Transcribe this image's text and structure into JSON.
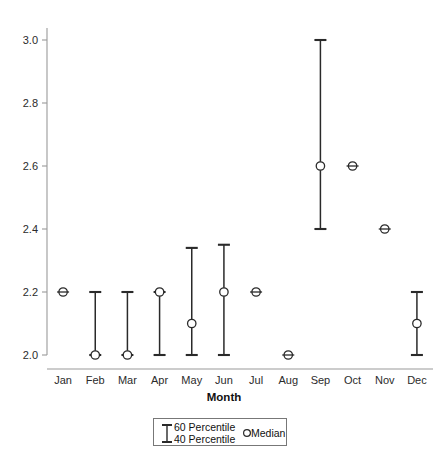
{
  "chart_data": {
    "type": "scatter",
    "title": "",
    "xlabel": "Month",
    "ylabel": "",
    "ylim": [
      2.0,
      3.0
    ],
    "yticks": [
      2.0,
      2.2,
      2.4,
      2.6,
      2.8,
      3.0
    ],
    "ytick_labels": [
      "2.0",
      "2.2",
      "2.4",
      "2.6",
      "2.8",
      "3.0"
    ],
    "grid": false,
    "legend_position": "below-axis-center",
    "categories": [
      "Jan",
      "Feb",
      "Mar",
      "Apr",
      "May",
      "Jun",
      "Jul",
      "Aug",
      "Sep",
      "Oct",
      "Nov",
      "Dec"
    ],
    "series": [
      {
        "name": "Median",
        "values": [
          2.2,
          2.0,
          2.0,
          2.2,
          2.1,
          2.2,
          2.2,
          2.0,
          2.6,
          2.6,
          2.4,
          2.1
        ]
      },
      {
        "name": "40 Percentile",
        "values": [
          2.2,
          2.0,
          2.0,
          2.0,
          2.0,
          2.0,
          2.2,
          2.0,
          2.4,
          2.6,
          2.4,
          2.0
        ]
      },
      {
        "name": "60 Percentile",
        "values": [
          2.2,
          2.2,
          2.2,
          2.2,
          2.34,
          2.35,
          2.2,
          2.0,
          3.0,
          2.6,
          2.4,
          2.2
        ]
      }
    ],
    "points": [
      {
        "month": "Jan",
        "low": 2.2,
        "median": 2.2,
        "high": 2.2
      },
      {
        "month": "Feb",
        "low": 2.0,
        "median": 2.0,
        "high": 2.2
      },
      {
        "month": "Mar",
        "low": 2.0,
        "median": 2.0,
        "high": 2.2
      },
      {
        "month": "Apr",
        "low": 2.0,
        "median": 2.2,
        "high": 2.2
      },
      {
        "month": "May",
        "low": 2.0,
        "median": 2.1,
        "high": 2.34
      },
      {
        "month": "Jun",
        "low": 2.0,
        "median": 2.2,
        "high": 2.35
      },
      {
        "month": "Jul",
        "low": 2.2,
        "median": 2.2,
        "high": 2.2
      },
      {
        "month": "Aug",
        "low": 2.0,
        "median": 2.0,
        "high": 2.0
      },
      {
        "month": "Sep",
        "low": 2.4,
        "median": 2.6,
        "high": 3.0
      },
      {
        "month": "Oct",
        "low": 2.6,
        "median": 2.6,
        "high": 2.6
      },
      {
        "month": "Nov",
        "low": 2.4,
        "median": 2.4,
        "high": 2.4
      },
      {
        "month": "Dec",
        "low": 2.0,
        "median": 2.1,
        "high": 2.2
      }
    ]
  },
  "legend": {
    "upper_label": "60 Percentile",
    "lower_label": "40 Percentile",
    "median_label": "Median"
  },
  "colors": {
    "marker": "#2a2a2a",
    "axis": "#9a9a9a",
    "text": "#1a1a1a",
    "background": "#ffffff"
  }
}
